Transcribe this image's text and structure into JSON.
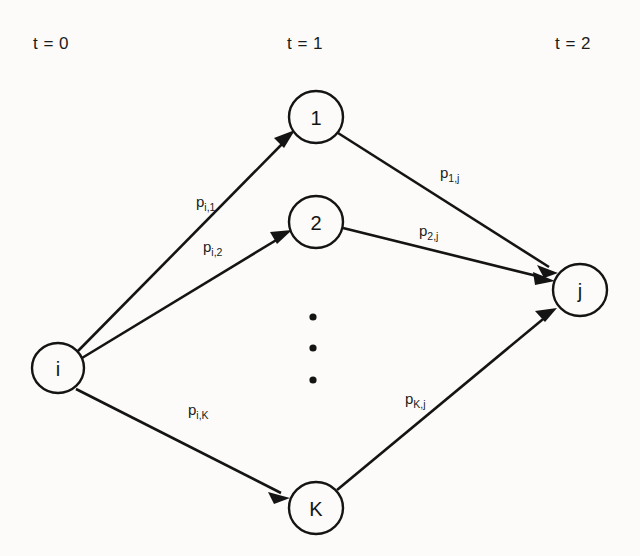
{
  "diagram": {
    "background_color": "#fcfbf9",
    "ink_color": "#141414",
    "time_axis": [
      {
        "id": "t0",
        "label": "t = 0",
        "x": 33,
        "y": 42
      },
      {
        "id": "t1",
        "label": "t = 1",
        "x": 287,
        "y": 42
      },
      {
        "id": "t2",
        "label": "t = 2",
        "x": 555,
        "y": 42
      }
    ],
    "nodes": [
      {
        "id": "i",
        "label": "i",
        "cx": 58,
        "cy": 368,
        "rx": 26,
        "ry": 25,
        "column": "t0"
      },
      {
        "id": "n1",
        "label": "1",
        "cx": 316,
        "cy": 117,
        "rx": 27,
        "ry": 26,
        "column": "t1"
      },
      {
        "id": "n2",
        "label": "2",
        "cx": 316,
        "cy": 222,
        "rx": 27,
        "ry": 26,
        "column": "t1"
      },
      {
        "id": "nK",
        "label": "K",
        "cx": 316,
        "cy": 508,
        "rx": 27,
        "ry": 26,
        "column": "t1"
      },
      {
        "id": "j",
        "label": "j",
        "cx": 580,
        "cy": 290,
        "rx": 27,
        "ry": 26,
        "column": "t2"
      }
    ],
    "ellipsis": {
      "name": "vertical-ellipsis",
      "x": 313,
      "dots_y": [
        317,
        348,
        380
      ],
      "radius": 3.6
    },
    "edges": [
      {
        "id": "i-1",
        "from": "i",
        "to": "n1",
        "label_base": "p",
        "label_sub": "i,1",
        "label_x": 196,
        "label_y": 207,
        "x1": 77,
        "y1": 352,
        "x2": 293,
        "y2": 133
      },
      {
        "id": "i-2",
        "from": "i",
        "to": "n2",
        "label_base": "p",
        "label_sub": "i,2",
        "label_x": 203,
        "label_y": 252,
        "x1": 82,
        "y1": 358,
        "x2": 289,
        "y2": 232
      },
      {
        "id": "i-K",
        "from": "i",
        "to": "nK",
        "label_base": "p",
        "label_sub": "i,K",
        "label_x": 188,
        "label_y": 415,
        "x1": 76,
        "y1": 389,
        "x2": 288,
        "y2": 497
      },
      {
        "id": "1-j",
        "from": "n1",
        "to": "j",
        "label_base": "p",
        "label_sub": "1,j",
        "label_x": 440,
        "label_y": 178,
        "x1": 338,
        "y1": 133,
        "x2": 559,
        "y2": 273
      },
      {
        "id": "2-j",
        "from": "n2",
        "to": "j",
        "label_base": "p",
        "label_sub": "2,j",
        "label_x": 419,
        "label_y": 236,
        "x1": 343,
        "y1": 228,
        "x2": 553,
        "y2": 281
      },
      {
        "id": "K-j",
        "from": "nK",
        "to": "j",
        "label_base": "p",
        "label_sub": "K,j",
        "label_x": 405,
        "label_y": 404,
        "x1": 337,
        "y1": 490,
        "x2": 556,
        "y2": 309
      }
    ]
  }
}
